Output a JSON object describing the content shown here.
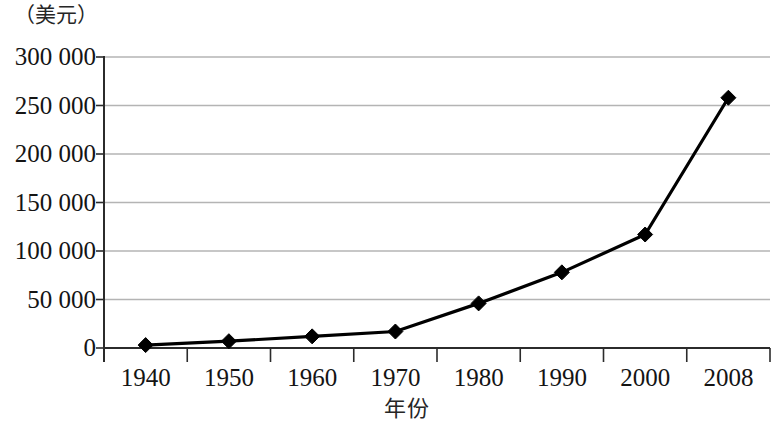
{
  "chart_data": {
    "type": "line",
    "title": "",
    "unit_caption": "（美元）",
    "xlabel": "年份",
    "ylabel": "",
    "categories": [
      "1940",
      "1950",
      "1960",
      "1970",
      "1980",
      "1990",
      "2000",
      "2008"
    ],
    "values": [
      3000,
      7000,
      12000,
      17000,
      46000,
      78000,
      117000,
      258000
    ],
    "ylim": [
      0,
      300000
    ],
    "y_ticks": [
      0,
      50000,
      100000,
      150000,
      200000,
      250000,
      300000
    ],
    "y_tick_labels": [
      "0",
      "50 000",
      "100 000",
      "150 000",
      "200 000",
      "250 000",
      "300 000"
    ],
    "grid": true,
    "legend": "none",
    "series": [
      {
        "name": "",
        "marker": "diamond",
        "color": "#000000",
        "values": [
          3000,
          7000,
          12000,
          17000,
          46000,
          78000,
          117000,
          258000
        ]
      }
    ]
  },
  "axis": {
    "y_caption": "（美元）",
    "x_title": "年份"
  }
}
